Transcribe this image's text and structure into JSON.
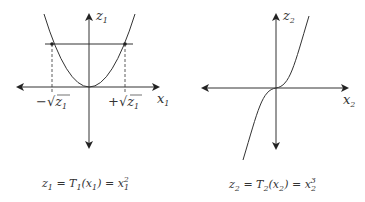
{
  "diagram": {
    "left": {
      "title": "z1 = T1(x1) = x1^2",
      "caption_parts": {
        "lhs": "z",
        "lhs_sub": "1",
        "eq1": " = T",
        "t_sub": "1",
        "arg_open": "(x",
        "arg_sub": "1",
        "arg_close": ") = x",
        "pow_sub": "1",
        "pow_sup": "2"
      },
      "x_axis_label": {
        "base": "x",
        "sub": "1"
      },
      "y_axis_label": {
        "base": "z",
        "sub": "1"
      },
      "tick_labels": {
        "neg": "−√z",
        "neg_sub": "1",
        "pos": "+√z",
        "pos_sub": "1"
      },
      "curve": "parabola",
      "horizontal_line": "z = z1",
      "dashed_lines": true
    },
    "right": {
      "title": "z2 = T2(x2) = x2^3",
      "caption_parts": {
        "lhs": "z",
        "lhs_sub": "2",
        "eq1": " = T",
        "t_sub": "2",
        "arg_open": "(x",
        "arg_sub": "2",
        "arg_close": ") = x",
        "pow_sub": "2",
        "pow_sup": "3"
      },
      "x_axis_label": {
        "base": "x",
        "sub": "2"
      },
      "y_axis_label": {
        "base": "z",
        "sub": "2"
      },
      "curve": "cubic"
    },
    "colors": {
      "line": "#333333",
      "background": "#ffffff"
    }
  }
}
